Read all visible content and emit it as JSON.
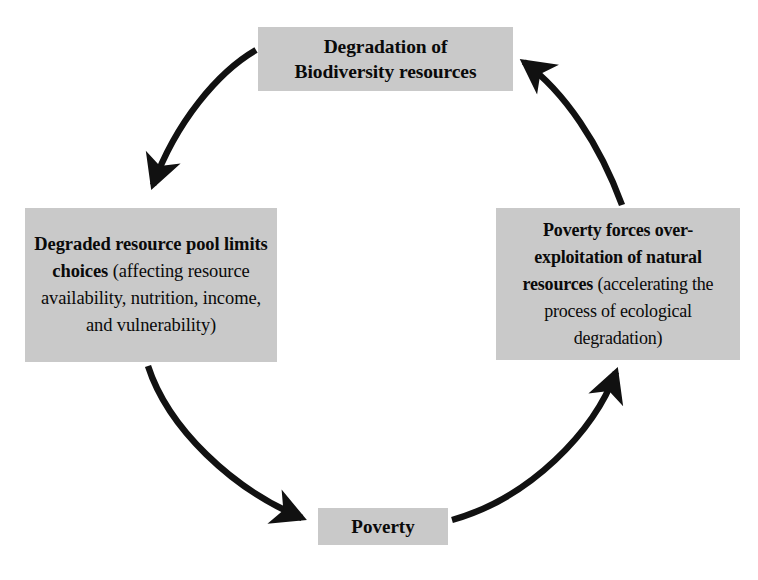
{
  "diagram": {
    "type": "cycle-diagram",
    "direction": "clockwise",
    "background_color": "#ffffff",
    "box_fill_color": "#c9c9c9",
    "arrow_color": "#111111",
    "text_color": "#0a0a0a"
  },
  "nodes": {
    "top": {
      "id": "degradation-of-biodiversity-resources",
      "line1": "Degradation of",
      "line2": "Biodiversity resources",
      "emphasis": "all-bold"
    },
    "left": {
      "id": "degraded-resource-pool-limits-choices",
      "bold_text": "Degraded resource pool limits choices",
      "regular_text": " (affecting resource availability, nutrition, income, and vulnerability)",
      "emphasis": "bold-lead-in"
    },
    "right": {
      "id": "poverty-forces-over-exploitation",
      "bold_text": "Poverty forces over-exploitation of natural resources",
      "regular_text": " (accelerating the process of ecological degradation)",
      "emphasis": "bold-lead-in"
    },
    "bottom": {
      "id": "poverty",
      "label": "Poverty",
      "emphasis": "all-bold"
    }
  },
  "arrows": [
    {
      "name": "arrow-top-to-left",
      "from": "top",
      "to": "left",
      "icon": "curved-arrow-icon",
      "description": "Degradation of Biodiversity resources leads to Degraded resource pool limits choices"
    },
    {
      "name": "arrow-left-to-poverty",
      "from": "left",
      "to": "bottom",
      "icon": "curved-arrow-icon",
      "description": "Degraded resource pool limits choices leads to Poverty"
    },
    {
      "name": "arrow-poverty-to-right",
      "from": "bottom",
      "to": "right",
      "icon": "curved-arrow-icon",
      "description": "Poverty leads to Poverty forces over-exploitation of natural resources"
    },
    {
      "name": "arrow-right-to-top",
      "from": "right",
      "to": "top",
      "icon": "curved-arrow-icon",
      "description": "Over-exploitation of natural resources leads to Degradation of Biodiversity resources"
    }
  ]
}
